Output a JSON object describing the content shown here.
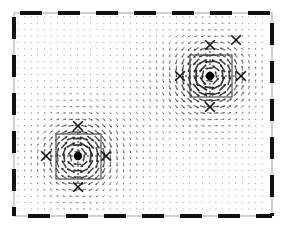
{
  "figure": {
    "type": "quiver-vector-field",
    "title": "",
    "background_color": "#ffffff",
    "arrow_color": "#2b2b2b",
    "frame": {
      "name": "dashed-boundary-frame",
      "x": 14,
      "y": 13,
      "width": 258,
      "height": 203,
      "line_color": "#111111",
      "style": "thick-dashed",
      "dash_length": 22,
      "gap_length": 16,
      "thickness": 4,
      "inner_thin_border": true,
      "inner_thin_color": "#8a8a8a"
    },
    "grid": {
      "spacing_x": 6.6,
      "spacing_y": 6.4,
      "x_start": 18,
      "x_end": 268,
      "y_start": 17,
      "y_end": 212,
      "arrow_head_length": 2.2,
      "max_arrow_length": 7.5
    }
  },
  "chart_data": {
    "type": "scatter",
    "title": "",
    "xlabel": "",
    "ylabel": "",
    "xlim": [
      0,
      1
    ],
    "ylim": [
      0,
      1
    ],
    "grid": false,
    "legend": null,
    "vortices": [
      {
        "name": "vortex-upper-right",
        "center_px": [
          210,
          76
        ],
        "center_norm": [
          0.76,
          0.31
        ],
        "rotation": "clockwise",
        "strength": 1.0,
        "box": {
          "x": 190,
          "y": 55,
          "width": 42,
          "height": 42
        },
        "crosshair_extent_px": 25,
        "x_markers_px": [
          [
            210,
            45
          ],
          [
            210,
            107
          ],
          [
            180,
            76
          ],
          [
            241,
            76
          ]
        ]
      },
      {
        "name": "vortex-lower-left",
        "center_px": [
          78,
          156
        ],
        "center_norm": [
          0.25,
          0.7
        ],
        "rotation": "counter-clockwise",
        "strength": 0.95,
        "box": {
          "x": 56,
          "y": 134,
          "width": 45,
          "height": 45
        },
        "crosshair_extent_px": 27,
        "x_markers_px": [
          [
            78,
            126
          ],
          [
            78,
            187
          ],
          [
            46,
            156
          ],
          [
            106,
            156
          ]
        ]
      }
    ],
    "saddle_points_px": [
      [
        236,
        40
      ]
    ],
    "flow_notes": [
      "upper-left region: strong rightward / down-right flow",
      "central band: strong curved flow sweeping down and around",
      "lower-right region: upward / up-right flow",
      "top-right corner: divergent flow near saddle"
    ]
  },
  "markers": {
    "center_dot": {
      "name": "vortex-center-dot",
      "radius": 4.2,
      "color": "#000000"
    },
    "x_marker": {
      "name": "probe-x-marker",
      "size": 4.8,
      "color": "#111111",
      "stroke": 1.6
    },
    "box": {
      "name": "roi-box",
      "stroke": "#4d4d4d",
      "stroke_width": 1.2,
      "fill": "none"
    },
    "crosshair": {
      "name": "crosshair-dashed",
      "color": "#333333",
      "dash": "2,2",
      "stroke_width": 1
    }
  }
}
